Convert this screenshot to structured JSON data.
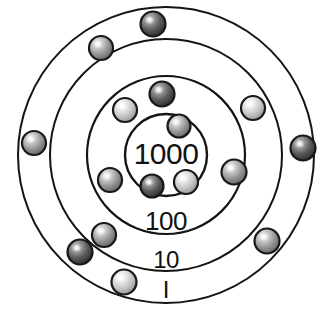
{
  "figure": {
    "background_color": "#ffffff",
    "line_color": "#141414",
    "text_color": "#111111",
    "center": {
      "x": 166,
      "y": 155
    }
  },
  "rings": [
    {
      "id": "ring-thousands",
      "label": "1000",
      "place_value": 1000,
      "radius": 41,
      "stroke_width": 2.4,
      "label_x": 166,
      "label_y": 164,
      "label_size": 30,
      "label_letter_spacing": "-0.5"
    },
    {
      "id": "ring-hundreds",
      "label": "100",
      "place_value": 100,
      "radius": 79,
      "stroke_width": 2.2,
      "label_x": 166,
      "label_y": 230,
      "label_size": 26,
      "label_letter_spacing": "-0.5"
    },
    {
      "id": "ring-tens",
      "label": "10",
      "place_value": 10,
      "radius": 116,
      "stroke_width": 2.0,
      "label_x": 166,
      "label_y": 268,
      "label_size": 24,
      "label_letter_spacing": "-0.5"
    },
    {
      "id": "ring-ones",
      "label": "I",
      "place_value": 1,
      "radius": 148,
      "stroke_width": 2.0,
      "label_x": 166,
      "label_y": 298,
      "label_size": 24,
      "label_letter_spacing": "0"
    }
  ],
  "beads": [
    {
      "id": "bead-ones-1",
      "ring": "ring-ones",
      "cx": 153,
      "cy": 24,
      "r": 12.5,
      "shade": "dark",
      "base_color": "#3a3a3a",
      "rim_color": "#111111"
    },
    {
      "id": "bead-ones-2",
      "ring": "ring-ones",
      "cx": 303,
      "cy": 148,
      "r": 12.5,
      "shade": "dark",
      "base_color": "#4a4a4a",
      "rim_color": "#111111"
    },
    {
      "id": "bead-ones-3",
      "ring": "ring-ones",
      "cx": 34,
      "cy": 143,
      "r": 12.0,
      "shade": "medium",
      "base_color": "#8a8a8a",
      "rim_color": "#161616"
    },
    {
      "id": "bead-ones-4",
      "ring": "ring-ones",
      "cx": 267,
      "cy": 241,
      "r": 12.5,
      "shade": "medium",
      "base_color": "#7e7e7e",
      "rim_color": "#131313"
    },
    {
      "id": "bead-ones-5",
      "ring": "ring-ones",
      "cx": 80,
      "cy": 252,
      "r": 12.5,
      "shade": "dark",
      "base_color": "#515151",
      "rim_color": "#111111"
    },
    {
      "id": "bead-tens-1",
      "ring": "ring-tens",
      "cx": 101,
      "cy": 48,
      "r": 12.0,
      "shade": "medium",
      "base_color": "#909090",
      "rim_color": "#171717"
    },
    {
      "id": "bead-tens-2",
      "ring": "ring-tens",
      "cx": 253,
      "cy": 108,
      "r": 12.0,
      "shade": "light",
      "base_color": "#b4b4b4",
      "rim_color": "#171717"
    },
    {
      "id": "bead-tens-3",
      "ring": "ring-tens",
      "cx": 104,
      "cy": 235,
      "r": 12.0,
      "shade": "medium",
      "base_color": "#8d8d8d",
      "rim_color": "#161616"
    },
    {
      "id": "bead-tens-4",
      "ring": "ring-tens",
      "cx": 124,
      "cy": 282,
      "r": 12.5,
      "shade": "light",
      "base_color": "#bdbdbd",
      "rim_color": "#171717"
    },
    {
      "id": "bead-hundreds-1",
      "ring": "ring-hundreds",
      "cx": 162,
      "cy": 94,
      "r": 12.5,
      "shade": "dark",
      "base_color": "#5a5a5a",
      "rim_color": "#121212"
    },
    {
      "id": "bead-hundreds-2",
      "ring": "ring-hundreds",
      "cx": 125,
      "cy": 110,
      "r": 12.0,
      "shade": "light",
      "base_color": "#b7b7b7",
      "rim_color": "#171717"
    },
    {
      "id": "bead-hundreds-3",
      "ring": "ring-hundreds",
      "cx": 110,
      "cy": 180,
      "r": 12.0,
      "shade": "medium",
      "base_color": "#8b8b8b",
      "rim_color": "#161616"
    },
    {
      "id": "bead-hundreds-4",
      "ring": "ring-hundreds",
      "cx": 234,
      "cy": 172,
      "r": 12.5,
      "shade": "medium",
      "base_color": "#7c7c7c",
      "rim_color": "#131313"
    },
    {
      "id": "bead-thousands-1",
      "ring": "ring-thousands",
      "cx": 179,
      "cy": 126,
      "r": 11.5,
      "shade": "medium",
      "base_color": "#9a9a9a",
      "rim_color": "#161616"
    },
    {
      "id": "bead-thousands-2",
      "ring": "ring-thousands",
      "cx": 152,
      "cy": 186,
      "r": 11.5,
      "shade": "dark",
      "base_color": "#5e5e5e",
      "rim_color": "#121212"
    },
    {
      "id": "bead-thousands-3",
      "ring": "ring-thousands",
      "cx": 186,
      "cy": 182,
      "r": 12.0,
      "shade": "light",
      "base_color": "#c0c0c0",
      "rim_color": "#171717"
    }
  ],
  "bead_counts": {
    "ring-thousands": 3,
    "ring-hundreds": 4,
    "ring-tens": 4,
    "ring-ones": 5
  }
}
